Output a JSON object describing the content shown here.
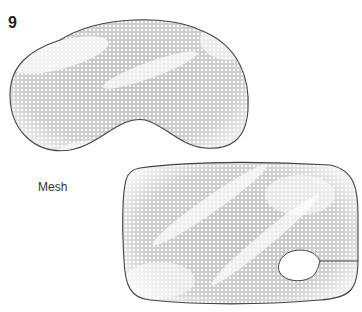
{
  "figure": {
    "number": "9",
    "label": "Mesh",
    "colors": {
      "outline": "#444444",
      "mesh_dot": "#bdbdbd",
      "background": "#ffffff"
    },
    "shapes": [
      {
        "name": "eye-mask-shape",
        "description": "sleep mask outline with mesh fill and nose cutout"
      },
      {
        "name": "rectangular-pad-shape",
        "description": "rounded rectangular pad with mesh fill and circular opening with slit on right edge"
      }
    ]
  }
}
